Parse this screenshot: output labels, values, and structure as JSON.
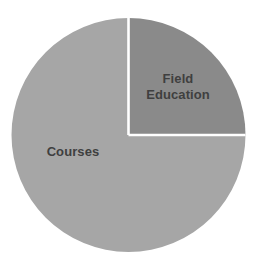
{
  "chart_data": {
    "type": "pie",
    "title": "",
    "subtitle": "",
    "xlabel": "",
    "ylabel": "",
    "grid": false,
    "legend_position": "none",
    "labels_inside_slices": true,
    "categories": [
      "Courses",
      "Field Education"
    ],
    "values": [
      75,
      25
    ],
    "units": "percent",
    "slices": [
      {
        "label": "Courses",
        "value": 75,
        "start_angle_deg": 90,
        "end_angle_deg": 360,
        "sweep_deg": 270,
        "color": "#a6a6a6"
      },
      {
        "label": "Field Education",
        "value": 25,
        "start_angle_deg": 0,
        "end_angle_deg": 90,
        "sweep_deg": 90,
        "color": "#8a8a8a"
      }
    ]
  },
  "chart": {
    "labels": {
      "courses": "Courses",
      "field_education": "Field\nEducation"
    },
    "colors": {
      "background": "#ffffff",
      "courses_slice": "#a6a6a6",
      "field_education_slice": "#8a8a8a",
      "divider": "#ffffff",
      "label_text": "#3f3f3f"
    },
    "geometry": {
      "center_x": 128.5,
      "center_y": 135,
      "radius": 117,
      "divider_width": 2.6
    }
  }
}
